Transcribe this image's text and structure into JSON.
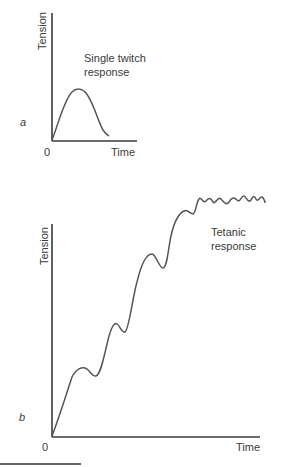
{
  "panels": [
    {
      "id": "a",
      "label": "a",
      "ylabel": "Tension",
      "xlabel": "Time",
      "origin_label": "0",
      "annotation": [
        "Single twitch",
        "response"
      ]
    },
    {
      "id": "b",
      "label": "b",
      "ylabel": "Tension",
      "xlabel": "Time",
      "origin_label": "0",
      "annotation": [
        "Tetanic",
        "response"
      ]
    }
  ],
  "colors": {
    "axis": "#3a3a3a",
    "curve": "#555555",
    "rule": "#666666"
  }
}
